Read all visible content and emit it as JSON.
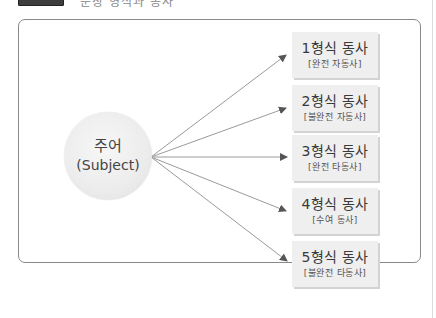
{
  "header": {
    "label_box": "",
    "title": "문장 형식과 동사"
  },
  "diagram": {
    "subject": {
      "korean": "주어",
      "english": "(Subject)"
    },
    "verbs": [
      {
        "title": "1형식 동사",
        "subtitle": "[완전 자동사]"
      },
      {
        "title": "2형식 동사",
        "subtitle": "[불완전 자동사]"
      },
      {
        "title": "3형식 동사",
        "subtitle": "[완전 타동사]"
      },
      {
        "title": "4형식 동사",
        "subtitle": "[수여 동사]"
      },
      {
        "title": "5형식 동사",
        "subtitle": "[불완전 타동사]"
      }
    ],
    "colors": {
      "arrow": "#9a9a9a",
      "arrowhead": "#555555",
      "box_fill": "#efefef",
      "circle_fill": "#ececec",
      "frame_border": "#8a8a8a"
    }
  }
}
